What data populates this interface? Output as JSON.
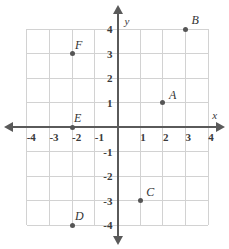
{
  "chart_data": {
    "type": "scatter",
    "title": "",
    "xlabel": "x",
    "ylabel": "y",
    "xlim": [
      -4,
      4
    ],
    "ylim": [
      -4,
      4
    ],
    "grid": true,
    "legend": "none",
    "xticks": [
      "-4",
      "-3",
      "-2",
      "-1",
      "1",
      "2",
      "3",
      "4"
    ],
    "yticks": [
      "4",
      "3",
      "2",
      "1",
      "-1",
      "-2",
      "-3",
      "-4"
    ],
    "xtick_values": [
      -4,
      -3,
      -2,
      -1,
      1,
      2,
      3,
      4
    ],
    "ytick_values": [
      4,
      3,
      2,
      1,
      -1,
      -2,
      -3,
      -4
    ],
    "points": [
      {
        "label": "A",
        "x": 2,
        "y": 1,
        "label_dx": 6,
        "label_dy": -14
      },
      {
        "label": "B",
        "x": 3,
        "y": 4,
        "label_dx": 6,
        "label_dy": -15
      },
      {
        "label": "C",
        "x": 1,
        "y": -3,
        "label_dx": 6,
        "label_dy": -15
      },
      {
        "label": "D",
        "x": -2,
        "y": -4,
        "label_dx": 3,
        "label_dy": -15
      },
      {
        "label": "E",
        "x": -2,
        "y": 0,
        "label_dx": 2,
        "label_dy": -15
      },
      {
        "label": "F",
        "x": -2,
        "y": 3,
        "label_dx": 3,
        "label_dy": -15
      }
    ],
    "point_color": "#555555",
    "axis_color": "#5a5a5a",
    "grid_color": "#d2d2d2"
  },
  "axes": {
    "x_name": "x",
    "y_name": "y"
  }
}
